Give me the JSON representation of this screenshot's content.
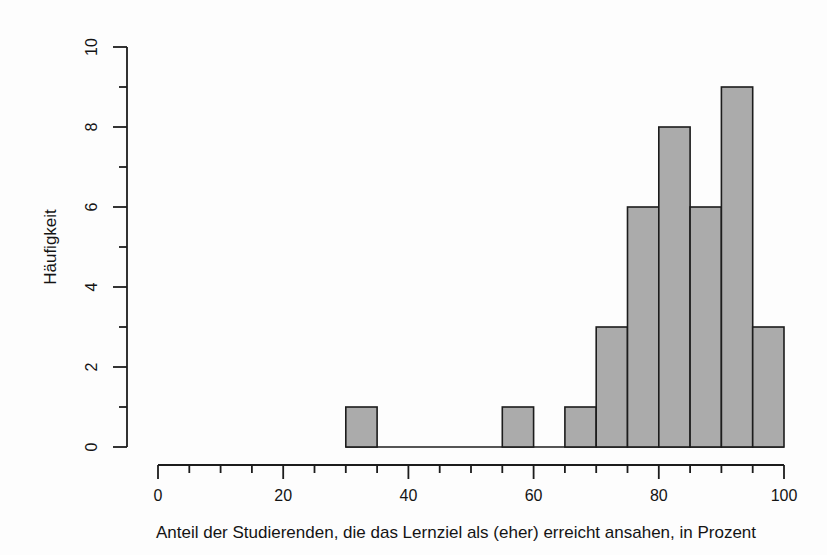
{
  "figure": {
    "background": "#fdfdfd"
  },
  "chart_data": {
    "type": "bar",
    "subtype": "histogram",
    "title": "",
    "xlabel": "Anteil der Studierenden, die das Lernziel als (eher) erreicht ansahen, in Prozent",
    "ylabel": "Häufigkeit",
    "bin_edges": [
      30,
      35,
      40,
      45,
      50,
      55,
      60,
      65,
      70,
      75,
      80,
      85,
      90,
      95,
      100
    ],
    "counts": [
      1,
      0,
      0,
      0,
      0,
      1,
      0,
      1,
      3,
      6,
      8,
      6,
      9,
      3
    ],
    "total_n": 28,
    "xlim": [
      0,
      100
    ],
    "ylim": [
      0,
      10
    ],
    "x_major_ticks": [
      0,
      20,
      40,
      60,
      80,
      100
    ],
    "x_major_tick_labels": [
      "0",
      "20",
      "40",
      "60",
      "80",
      "100"
    ],
    "x_minor_ticks": [
      5,
      10,
      15,
      25,
      30,
      35,
      45,
      50,
      55,
      65,
      70,
      75,
      85,
      90,
      95
    ],
    "y_major_ticks": [
      0,
      2,
      4,
      6,
      8,
      10
    ],
    "y_major_tick_labels": [
      "0",
      "2",
      "4",
      "6",
      "8",
      "10"
    ],
    "y_minor_ticks": [
      1,
      3,
      5,
      7,
      9
    ],
    "grid": "off",
    "legend": "none",
    "colors": {
      "bar_fill": "#ababab",
      "bar_stroke": "#1c1c1c",
      "axis": "#1c1c1c",
      "text": "#141414"
    }
  }
}
